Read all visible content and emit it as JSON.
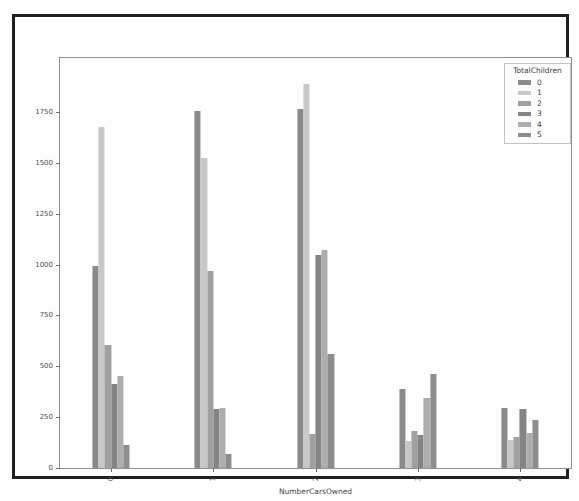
{
  "figure": {
    "xlabel": "NumberCarsOwned",
    "legend_title": "TotalChildren"
  },
  "chart_data": {
    "type": "bar",
    "title": "",
    "xlabel": "NumberCarsOwned",
    "ylabel": "",
    "categories": [
      "0",
      "1",
      "2",
      "3",
      "4"
    ],
    "series": [
      {
        "name": "0",
        "color": "#8a8a8a",
        "values": [
          995,
          1755,
          1765,
          390,
          295
        ]
      },
      {
        "name": "1",
        "color": "#c8c8c8",
        "values": [
          1675,
          1525,
          1885,
          135,
          140
        ]
      },
      {
        "name": "2",
        "color": "#a0a0a0",
        "values": [
          605,
          970,
          165,
          180,
          150
        ]
      },
      {
        "name": "3",
        "color": "#848484",
        "values": [
          415,
          290,
          1045,
          160,
          290
        ]
      },
      {
        "name": "4",
        "color": "#adadad",
        "values": [
          450,
          295,
          1070,
          345,
          170
        ]
      },
      {
        "name": "5",
        "color": "#8d8d8d",
        "values": [
          115,
          70,
          560,
          460,
          235
        ]
      }
    ],
    "yticks": [
      0,
      250,
      500,
      750,
      1000,
      1250,
      1500,
      1750
    ],
    "ylim": [
      0,
      2015
    ],
    "legend_title": "TotalChildren",
    "legend_position": "upper right",
    "grid": false
  }
}
